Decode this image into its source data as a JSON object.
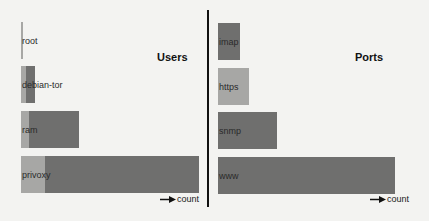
{
  "chart_data": [
    {
      "type": "bar",
      "orientation": "horizontal",
      "stacked": true,
      "title": "Users",
      "xlabel": "count",
      "ylabel": "",
      "categories": [
        "root",
        "debian-tor",
        "ram",
        "privoxy"
      ],
      "series": [
        {
          "name": "light",
          "color": "#a7a7a5",
          "values": [
            1,
            3,
            5,
            14
          ]
        },
        {
          "name": "dark",
          "color": "#6f6f6e",
          "values": [
            0,
            5,
            28,
            89
          ]
        }
      ],
      "totals": [
        1,
        8,
        33,
        103
      ],
      "grid": false,
      "legend": "none"
    },
    {
      "type": "bar",
      "orientation": "horizontal",
      "stacked": true,
      "title": "Ports",
      "xlabel": "count",
      "ylabel": "",
      "categories": [
        "imap",
        "https",
        "snmp",
        "www"
      ],
      "series": [
        {
          "name": "light",
          "color": "#a7a7a5",
          "values": [
            0,
            18,
            0,
            0
          ]
        },
        {
          "name": "dark",
          "color": "#6f6f6e",
          "values": [
            13,
            0,
            34,
            102
          ]
        }
      ],
      "totals": [
        13,
        18,
        34,
        102
      ],
      "grid": false,
      "legend": "none"
    }
  ],
  "users": {
    "title": "Users",
    "axis_label": "count",
    "bars": [
      {
        "label": "root",
        "left": 21,
        "top": 22,
        "height": 37,
        "light": 2,
        "dark": 0
      },
      {
        "label": "debian-tor",
        "left": 21,
        "top": 66,
        "height": 37,
        "light": 5,
        "dark": 9
      },
      {
        "label": "ram",
        "left": 21,
        "top": 111,
        "height": 37,
        "light": 8,
        "dark": 50
      },
      {
        "label": "privoxy",
        "left": 21,
        "top": 156,
        "height": 37,
        "light": 24,
        "dark": 154
      }
    ]
  },
  "ports": {
    "title": "Ports",
    "axis_label": "count",
    "bars": [
      {
        "label": "imap",
        "left": 9,
        "top": 23,
        "height": 37,
        "light": 0,
        "dark": 22
      },
      {
        "label": "https",
        "left": 9,
        "top": 68,
        "height": 37,
        "light": 31,
        "dark": 0
      },
      {
        "label": "snmp",
        "left": 9,
        "top": 112,
        "height": 37,
        "light": 0,
        "dark": 59
      },
      {
        "label": "www",
        "left": 9,
        "top": 157,
        "height": 37,
        "light": 0,
        "dark": 177
      }
    ]
  },
  "colors": {
    "light_segment": "#a7a7a5",
    "dark_segment": "#6f6f6e",
    "divider": "#111111",
    "background": "#f3f3f1"
  }
}
